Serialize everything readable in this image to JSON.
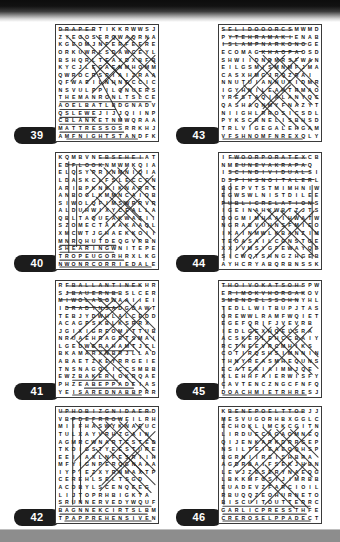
{
  "page": {
    "kind": "word-search-solutions",
    "top_band_color": "#0d0d0d",
    "bottom_band_color": "#8d8d8d",
    "paper_color": "#ffffff",
    "badge_color": "#1c1c1c",
    "badge_text_color": "#ffffff",
    "grid_border_color": "#3a3a3a",
    "letter_color": "#141414",
    "strike_color": "#2b2b2b",
    "grid_size": 15
  },
  "puzzles": [
    {
      "number": "39",
      "position": {
        "column": "left",
        "row": 0
      },
      "rows": [
        "DRAPERTIKKRWWSJ",
        "ZYEGOSERQWAQRNA",
        "KGEOMJNFERFEERE",
        "ORKUWRLSDAWCEYL",
        "BSHQRLTEAXDXBFB",
        "KYCJLEGAENMHOMM",
        "QWROCRSPIAIZRAA",
        "QFWAEILNHNGCCIC",
        "NSVULPPILQNUERS",
        "THEMANRONLTSLCE",
        "AOELBATLBDGNADV",
        "QSLEWEJIJJQIINP",
        "CBLANKETNMWQRAA",
        "MATTRESSOSRRKHJ",
        "AMFNIGHTSTANDFK"
      ],
      "strikes": [
        {
          "x1": 3,
          "y1": 4,
          "x2": 38,
          "y2": 4
        },
        {
          "x1": 3,
          "y1": 77,
          "x2": 96,
          "y2": 77
        },
        {
          "x1": 3,
          "y1": 85,
          "x2": 60,
          "y2": 85
        },
        {
          "x1": 3,
          "y1": 93,
          "x2": 40,
          "y2": 93
        },
        {
          "x1": 3,
          "y1": 100,
          "x2": 66,
          "y2": 100
        },
        {
          "x1": 3,
          "y1": 108,
          "x2": 68,
          "y2": 108
        },
        {
          "x1": 10,
          "y1": 115,
          "x2": 82,
          "y2": 115
        },
        {
          "x1": 10,
          "y1": 10,
          "x2": 60,
          "y2": 60
        },
        {
          "x1": 24,
          "y1": 10,
          "x2": 76,
          "y2": 62
        },
        {
          "x1": 40,
          "y1": 10,
          "x2": 94,
          "y2": 64
        },
        {
          "x1": 58,
          "y1": 10,
          "x2": 100,
          "y2": 52
        },
        {
          "x1": 72,
          "y1": 10,
          "x2": 100,
          "y2": 38
        },
        {
          "x1": 60,
          "y1": 10,
          "x2": 14,
          "y2": 56
        },
        {
          "x1": 78,
          "y1": 10,
          "x2": 30,
          "y2": 58
        },
        {
          "x1": 94,
          "y1": 12,
          "x2": 46,
          "y2": 60
        },
        {
          "x1": 100,
          "y1": 30,
          "x2": 64,
          "y2": 66
        },
        {
          "x1": 36,
          "y1": 40,
          "x2": 66,
          "y2": 96
        },
        {
          "x1": 48,
          "y1": 34,
          "x2": 86,
          "y2": 72
        },
        {
          "x1": 64,
          "y1": 40,
          "x2": 36,
          "y2": 68
        }
      ]
    },
    {
      "number": "40",
      "position": {
        "column": "left",
        "row": 1
      },
      "rows": [
        "KQMBVNEBSEHEIAT",
        "EDFLOOKNMWMKQIA",
        "ELQSYPRINMNIQIA",
        "LDASKCLFSLECCCN",
        "ARIBPKNKIKNARRT",
        "ANBOGLKMMNCAIQB",
        "SIWOLQFIMSWRRVR",
        "ALDUHWIXYCEALLA",
        "QBLTAQUEAKWAZII",
        "SZOMECTAAAKAAQL",
        "XMCWTJGHAEKKOII",
        "MNRQHUTDEQGVRBN",
        "SHEARINGWNITEPE",
        "TROPEUGORHRXLKG",
        "NWONRCORRIEDALE"
      ],
      "strikes": [
        {
          "x1": 44,
          "y1": 4,
          "x2": 88,
          "y2": 4
        },
        {
          "x1": 10,
          "y1": 11,
          "x2": 48,
          "y2": 11
        },
        {
          "x1": 3,
          "y1": 93,
          "x2": 60,
          "y2": 93
        },
        {
          "x1": 3,
          "y1": 100,
          "x2": 58,
          "y2": 100
        },
        {
          "x1": 3,
          "y1": 108,
          "x2": 68,
          "y2": 108
        },
        {
          "x1": 3,
          "y1": 115,
          "x2": 96,
          "y2": 115
        },
        {
          "x1": 12,
          "y1": 8,
          "x2": 12,
          "y2": 100
        },
        {
          "x1": 20,
          "y1": 12,
          "x2": 20,
          "y2": 94
        },
        {
          "x1": 34,
          "y1": 16,
          "x2": 86,
          "y2": 68
        },
        {
          "x1": 48,
          "y1": 14,
          "x2": 98,
          "y2": 64
        },
        {
          "x1": 62,
          "y1": 14,
          "x2": 100,
          "y2": 52
        },
        {
          "x1": 78,
          "y1": 14,
          "x2": 100,
          "y2": 36
        },
        {
          "x1": 86,
          "y1": 16,
          "x2": 36,
          "y2": 66
        },
        {
          "x1": 98,
          "y1": 22,
          "x2": 50,
          "y2": 70
        },
        {
          "x1": 72,
          "y1": 14,
          "x2": 26,
          "y2": 60
        },
        {
          "x1": 56,
          "y1": 16,
          "x2": 30,
          "y2": 42
        },
        {
          "x1": 40,
          "y1": 44,
          "x2": 84,
          "y2": 88
        },
        {
          "x1": 54,
          "y1": 44,
          "x2": 96,
          "y2": 86
        },
        {
          "x1": 68,
          "y1": 48,
          "x2": 100,
          "y2": 80
        },
        {
          "x1": 84,
          "y1": 46,
          "x2": 44,
          "y2": 86
        }
      ]
    },
    {
      "number": "41",
      "position": {
        "column": "left",
        "row": 2
      },
      "rows": [
        "RFBALLANTINEKHR",
        "SJBAUERNBBSLCER",
        "MIWOLAGOWAAIIEI",
        "IDRADYNSADGDAWT",
        "TEBJYDWHLALCEDD",
        "ACAGPSKBLKSRRX",
        "JGIXIGREOMITTUB",
        "NRUAEHRAGETSMAI",
        "LGEDWGRAHAMTJCL",
        "BKAMARXNBRJLLAD",
        "ABAETZKEYRRGEIE",
        "TNSNAGQLICCSMBB",
        "EWZBAKERIOKRQAE",
        "PHZEABEPPADEIAS",
        "YEISAREDNABBPRR"
      ],
      "strikes": [
        {
          "x1": 10,
          "y1": 4,
          "x2": 86,
          "y2": 4
        },
        {
          "x1": 10,
          "y1": 11,
          "x2": 62,
          "y2": 11
        },
        {
          "x1": 3,
          "y1": 18,
          "x2": 52,
          "y2": 18
        },
        {
          "x1": 10,
          "y1": 26,
          "x2": 62,
          "y2": 26
        },
        {
          "x1": 30,
          "y1": 70,
          "x2": 78,
          "y2": 70
        },
        {
          "x1": 16,
          "y1": 100,
          "x2": 62,
          "y2": 100
        },
        {
          "x1": 28,
          "y1": 108,
          "x2": 78,
          "y2": 108
        },
        {
          "x1": 16,
          "y1": 115,
          "x2": 86,
          "y2": 115
        },
        {
          "x1": 28,
          "y1": 16,
          "x2": 84,
          "y2": 72
        },
        {
          "x1": 42,
          "y1": 16,
          "x2": 96,
          "y2": 70
        },
        {
          "x1": 56,
          "y1": 16,
          "x2": 100,
          "y2": 60
        },
        {
          "x1": 70,
          "y1": 18,
          "x2": 100,
          "y2": 48
        },
        {
          "x1": 84,
          "y1": 18,
          "x2": 36,
          "y2": 66
        },
        {
          "x1": 96,
          "y1": 26,
          "x2": 48,
          "y2": 74
        },
        {
          "x1": 70,
          "y1": 18,
          "x2": 22,
          "y2": 62
        },
        {
          "x1": 56,
          "y1": 20,
          "x2": 14,
          "y2": 58
        },
        {
          "x1": 20,
          "y1": 60,
          "x2": 64,
          "y2": 104
        },
        {
          "x1": 34,
          "y1": 62,
          "x2": 78,
          "y2": 104
        },
        {
          "x1": 46,
          "y1": 66,
          "x2": 92,
          "y2": 110
        },
        {
          "x1": 80,
          "y1": 56,
          "x2": 36,
          "y2": 100
        }
      ]
    },
    {
      "number": "42",
      "position": {
        "column": "left",
        "row": 3
      },
      "rows": [
        "UPHOBIZGNIDAERD",
        "VBPDEFRROWEILRH",
        "MIIFHASWYKNAEUC",
        "TULXAYVRHZGAIN",
        "AGMRCWNARTESTED",
        "TKDIGSTYEESTURE",
        "EEIIAXLNFESRIIH",
        "MFYIGNPERQGNAAA",
        "IYPIEZXYRNMAXTP",
        "CEREHLSELTSGD",
        "ACDBYLSCENQEEG",
        "LIJTOPRHBIGKTA",
        "SRUNNERVEDYWQUF",
        "BAGNNEKCIRTSLBM",
        "TPAPPREHENSIVEN"
      ],
      "strikes": [
        {
          "x1": 3,
          "y1": 4,
          "x2": 96,
          "y2": 4
        },
        {
          "x1": 14,
          "y1": 11,
          "x2": 66,
          "y2": 11
        },
        {
          "x1": 3,
          "y1": 100,
          "x2": 96,
          "y2": 100
        },
        {
          "x1": 3,
          "y1": 108,
          "x2": 92,
          "y2": 108
        },
        {
          "x1": 8,
          "y1": 115,
          "x2": 96,
          "y2": 115
        },
        {
          "x1": 16,
          "y1": 10,
          "x2": 16,
          "y2": 98
        },
        {
          "x1": 24,
          "y1": 14,
          "x2": 24,
          "y2": 96
        },
        {
          "x1": 36,
          "y1": 14,
          "x2": 88,
          "y2": 66
        },
        {
          "x1": 50,
          "y1": 14,
          "x2": 100,
          "y2": 64
        },
        {
          "x1": 64,
          "y1": 14,
          "x2": 100,
          "y2": 50
        },
        {
          "x1": 80,
          "y1": 16,
          "x2": 100,
          "y2": 36
        },
        {
          "x1": 88,
          "y1": 16,
          "x2": 34,
          "y2": 70
        },
        {
          "x1": 100,
          "y1": 24,
          "x2": 46,
          "y2": 78
        },
        {
          "x1": 72,
          "y1": 14,
          "x2": 22,
          "y2": 64
        },
        {
          "x1": 56,
          "y1": 16,
          "x2": 18,
          "y2": 54
        },
        {
          "x1": 40,
          "y1": 42,
          "x2": 86,
          "y2": 88
        },
        {
          "x1": 54,
          "y1": 44,
          "x2": 96,
          "y2": 86
        },
        {
          "x1": 68,
          "y1": 46,
          "x2": 100,
          "y2": 78
        },
        {
          "x1": 84,
          "y1": 44,
          "x2": 44,
          "y2": 84
        }
      ]
    },
    {
      "number": "43",
      "position": {
        "column": "right",
        "row": 0
      },
      "rows": [
        "SELIDOOORCSMWMD",
        "PYTEHRAMAKIENAB",
        "ISLAMPNARKONOGE",
        "ECOMAGKHAOPAOSD",
        "SHWIIDNDMRSFWAN",
        "EILGSMISMNMFJMA",
        "CASXHMGJRQZRAI",
        "NNUTUIANNUFIDMR",
        "IGYHNILEAHTRMAO",
        "YRESTAQIALANYQC",
        "QASHAQNMYFNAZYT",
        "NIIGHLRROSICSDL",
        "PYKSCRNELISBHSD",
        "TRLVIGEGALEHGAM",
        "VFSHNOMFNREXQLY"
      ],
      "strikes": [
        {
          "x1": 3,
          "y1": 4,
          "x2": 74,
          "y2": 4
        },
        {
          "x1": 10,
          "y1": 11,
          "x2": 74,
          "y2": 11
        },
        {
          "x1": 3,
          "y1": 18,
          "x2": 88,
          "y2": 18
        },
        {
          "x1": 40,
          "y1": 26,
          "x2": 84,
          "y2": 26
        },
        {
          "x1": 3,
          "y1": 115,
          "x2": 84,
          "y2": 115
        },
        {
          "x1": 30,
          "y1": 30,
          "x2": 80,
          "y2": 80
        },
        {
          "x1": 44,
          "y1": 30,
          "x2": 94,
          "y2": 80
        },
        {
          "x1": 58,
          "y1": 32,
          "x2": 100,
          "y2": 74
        },
        {
          "x1": 72,
          "y1": 34,
          "x2": 100,
          "y2": 62
        },
        {
          "x1": 80,
          "y1": 32,
          "x2": 30,
          "y2": 82
        },
        {
          "x1": 94,
          "y1": 34,
          "x2": 44,
          "y2": 84
        },
        {
          "x1": 66,
          "y1": 30,
          "x2": 18,
          "y2": 78
        },
        {
          "x1": 52,
          "y1": 34,
          "x2": 14,
          "y2": 72
        },
        {
          "x1": 24,
          "y1": 60,
          "x2": 66,
          "y2": 102
        },
        {
          "x1": 38,
          "y1": 62,
          "x2": 80,
          "y2": 104
        },
        {
          "x1": 54,
          "y1": 66,
          "x2": 94,
          "y2": 106
        },
        {
          "x1": 72,
          "y1": 60,
          "x2": 30,
          "y2": 102
        }
      ]
    },
    {
      "number": "44",
      "position": {
        "column": "right",
        "row": 1
      },
      "rows": [
        "IFWOORPORATEXCB",
        "NMEUNEVAKRAPAQ",
        "ISCINDIVIDUALSI",
        "DSPIHSNOITALERL",
        "BOEPVTSTMIMHNIW",
        "EGWSWLNISTDILEE",
        "PUBLICRELATIONS",
        "IGEINAHKWBTZJTS",
        "DOGMIMHAAIHWATW",
        "NGRABVUHNSFMIEO",
        "IKAINMWLKBANZIM",
        "TEOASAILCONSTGE",
        "XXIVMSYGFEWAYQE",
        "SICWQTSHNGZHGEB",
        "AYHCRYABQRBNSSK"
      ],
      "strikes": [
        {
          "x1": 10,
          "y1": 4,
          "x2": 88,
          "y2": 4
        },
        {
          "x1": 16,
          "y1": 11,
          "x2": 88,
          "y2": 11
        },
        {
          "x1": 10,
          "y1": 18,
          "x2": 92,
          "y2": 18
        },
        {
          "x1": 10,
          "y1": 26,
          "x2": 96,
          "y2": 26
        },
        {
          "x1": 3,
          "y1": 50,
          "x2": 96,
          "y2": 50
        },
        {
          "x1": 4,
          "y1": 32,
          "x2": 4,
          "y2": 108
        },
        {
          "x1": 11,
          "y1": 30,
          "x2": 11,
          "y2": 106
        },
        {
          "x1": 94,
          "y1": 32,
          "x2": 94,
          "y2": 106
        },
        {
          "x1": 34,
          "y1": 56,
          "x2": 84,
          "y2": 106
        },
        {
          "x1": 48,
          "y1": 56,
          "x2": 96,
          "y2": 104
        },
        {
          "x1": 62,
          "y1": 58,
          "x2": 100,
          "y2": 96
        },
        {
          "x1": 76,
          "y1": 58,
          "x2": 100,
          "y2": 82
        },
        {
          "x1": 84,
          "y1": 56,
          "x2": 34,
          "y2": 106
        },
        {
          "x1": 96,
          "y1": 58,
          "x2": 48,
          "y2": 106
        },
        {
          "x1": 70,
          "y1": 56,
          "x2": 22,
          "y2": 104
        },
        {
          "x1": 56,
          "y1": 58,
          "x2": 16,
          "y2": 98
        },
        {
          "x1": 42,
          "y1": 60,
          "x2": 14,
          "y2": 88
        }
      ]
    },
    {
      "number": "45",
      "position": {
        "column": "right",
        "row": 2
      },
      "rows": [
        "THOIVOKATSOHSPW",
        "ERIMOKVHORGAKOV",
        "SMENDELSSOHNYHL",
        "TEDLLWITBUPJTAS",
        "OREWWLRAMFWQIET",
        "EGEFQRIFJVEVRB",
        "IEDLGEXHQELSRA",
        "ACSKERLEHCCBAIY",
        "RCTNEEVRCMHIKS",
        "COTIRQSHSIMNNIN",
        "THNYREASMHEQUNS",
        "ECATEKIAIMMJQE",
        "KLEHHFAIERWISFY",
        "CAVTENCZNGCFNFQ",
        "DOACHMIETRHRESJ"
      ],
      "strikes": [
        {
          "x1": 3,
          "y1": 4,
          "x2": 84,
          "y2": 4
        },
        {
          "x1": 10,
          "y1": 11,
          "x2": 86,
          "y2": 11
        },
        {
          "x1": 3,
          "y1": 18,
          "x2": 80,
          "y2": 18
        },
        {
          "x1": 3,
          "y1": 115,
          "x2": 88,
          "y2": 115
        },
        {
          "x1": 4,
          "y1": 26,
          "x2": 4,
          "y2": 108
        },
        {
          "x1": 30,
          "y1": 44,
          "x2": 80,
          "y2": 94
        },
        {
          "x1": 44,
          "y1": 44,
          "x2": 94,
          "y2": 94
        },
        {
          "x1": 58,
          "y1": 46,
          "x2": 100,
          "y2": 88
        },
        {
          "x1": 72,
          "y1": 48,
          "x2": 100,
          "y2": 76
        },
        {
          "x1": 80,
          "y1": 44,
          "x2": 30,
          "y2": 94
        },
        {
          "x1": 94,
          "y1": 46,
          "x2": 44,
          "y2": 96
        },
        {
          "x1": 66,
          "y1": 44,
          "x2": 18,
          "y2": 90
        },
        {
          "x1": 52,
          "y1": 46,
          "x2": 14,
          "y2": 84
        },
        {
          "x1": 36,
          "y1": 48,
          "x2": 14,
          "y2": 70
        }
      ]
    },
    {
      "number": "46",
      "position": {
        "column": "right",
        "row": 3
      },
      "rows": [
        "KBENEPOELTTOBJJ",
        "MESVUGORHBXGGLC",
        "ECHOKLIMCKCGITN",
        "LIRDUECAGAOMNEQ",
        "QIJENKARKDRRGEP",
        "NSILTEIEAEQQHSP",
        "BGRNIIRSISHBRA",
        "AGDRBAIFSEKJHBN",
        "LEVJZESERYNAEQGS",
        "LBKKMFGSIJIMRBB",
        "EUADEVZFARCIOIL",
        "RBUQQZEOHURNETO",
        "BISCUITOUTTERRC",
        "GARLICPRESSTHFE",
        "CREROSELPPADECT"
      ],
      "strikes": [
        {
          "x1": 10,
          "y1": 4,
          "x2": 84,
          "y2": 4
        },
        {
          "x1": 3,
          "y1": 100,
          "x2": 92,
          "y2": 100
        },
        {
          "x1": 3,
          "y1": 108,
          "x2": 88,
          "y2": 108
        },
        {
          "x1": 3,
          "y1": 115,
          "x2": 92,
          "y2": 115
        },
        {
          "x1": 4,
          "y1": 10,
          "x2": 4,
          "y2": 98
        },
        {
          "x1": 30,
          "y1": 20,
          "x2": 80,
          "y2": 70
        },
        {
          "x1": 44,
          "y1": 20,
          "x2": 94,
          "y2": 70
        },
        {
          "x1": 58,
          "y1": 22,
          "x2": 100,
          "y2": 64
        },
        {
          "x1": 72,
          "y1": 22,
          "x2": 100,
          "y2": 50
        },
        {
          "x1": 80,
          "y1": 20,
          "x2": 30,
          "y2": 70
        },
        {
          "x1": 94,
          "y1": 22,
          "x2": 44,
          "y2": 72
        },
        {
          "x1": 66,
          "y1": 20,
          "x2": 18,
          "y2": 66
        },
        {
          "x1": 52,
          "y1": 22,
          "x2": 14,
          "y2": 60
        },
        {
          "x1": 30,
          "y1": 56,
          "x2": 76,
          "y2": 102
        },
        {
          "x1": 46,
          "y1": 58,
          "x2": 90,
          "y2": 102
        },
        {
          "x1": 74,
          "y1": 54,
          "x2": 32,
          "y2": 96
        },
        {
          "x1": 88,
          "y1": 56,
          "x2": 46,
          "y2": 98
        }
      ]
    }
  ]
}
